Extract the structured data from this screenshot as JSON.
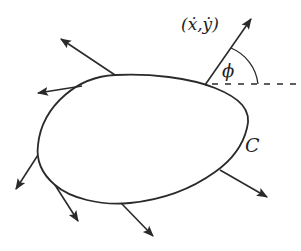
{
  "diagram": {
    "type": "closed-curve-with-velocity-vectors",
    "colors": {
      "stroke": "#2a2a2a",
      "background": "#ffffff",
      "text": "#1e1e1e"
    },
    "curve": {
      "label": "C",
      "description": "closed smooth curve (blob shape)"
    },
    "velocity_label": "(ẋ,ẏ)",
    "angle_label": "ϕ",
    "reference_line": "horizontal dashed reference line",
    "arrows": [
      {
        "name": "arrow-top-left-upper",
        "from": [
          115,
          75
        ],
        "to": [
          60,
          38
        ]
      },
      {
        "name": "arrow-top-left-lower",
        "from": [
          80,
          86
        ],
        "to": [
          37,
          93
        ]
      },
      {
        "name": "arrow-left",
        "from": [
          38,
          155
        ],
        "to": [
          15,
          190
        ]
      },
      {
        "name": "arrow-bottom-left",
        "from": [
          55,
          185
        ],
        "to": [
          78,
          222
        ]
      },
      {
        "name": "arrow-bottom",
        "from": [
          120,
          203
        ],
        "to": [
          153,
          237
        ]
      },
      {
        "name": "arrow-bottom-right",
        "from": [
          220,
          170
        ],
        "to": [
          268,
          197
        ]
      },
      {
        "name": "arrow-velocity",
        "from": [
          205,
          85
        ],
        "to": [
          252,
          18
        ]
      }
    ]
  }
}
